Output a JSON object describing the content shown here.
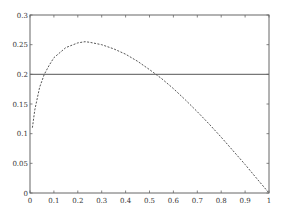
{
  "chart_data": {
    "type": "line",
    "title": "",
    "xlabel": "",
    "ylabel": "",
    "xlim": [
      0,
      1
    ],
    "ylim": [
      0,
      0.3
    ],
    "grid": false,
    "legend": null,
    "x_ticks": [
      "0",
      "0.1",
      "0.2",
      "0.3",
      "0.4",
      "0.5",
      "0.6",
      "0.7",
      "0.8",
      "0.9",
      "1"
    ],
    "y_ticks": [
      "0",
      "0.05",
      "0.1",
      "0.15",
      "0.2",
      "0.25",
      "0.3"
    ],
    "series": [
      {
        "name": "curve",
        "style": "dashed",
        "color": "#555555",
        "x": [
          0.01,
          0.02,
          0.04,
          0.06,
          0.08,
          0.1,
          0.15,
          0.2,
          0.23,
          0.25,
          0.3,
          0.35,
          0.4,
          0.45,
          0.5,
          0.55,
          0.6,
          0.65,
          0.7,
          0.75,
          0.8,
          0.85,
          0.9,
          0.95,
          1.0
        ],
        "y": [
          0.11,
          0.14,
          0.178,
          0.2,
          0.215,
          0.228,
          0.245,
          0.253,
          0.255,
          0.254,
          0.25,
          0.243,
          0.234,
          0.222,
          0.208,
          0.193,
          0.176,
          0.157,
          0.137,
          0.116,
          0.094,
          0.071,
          0.048,
          0.024,
          0.0
        ]
      },
      {
        "name": "constant",
        "style": "solid",
        "color": "#555555",
        "x": [
          0,
          1
        ],
        "y": [
          0.2,
          0.2
        ]
      }
    ]
  }
}
